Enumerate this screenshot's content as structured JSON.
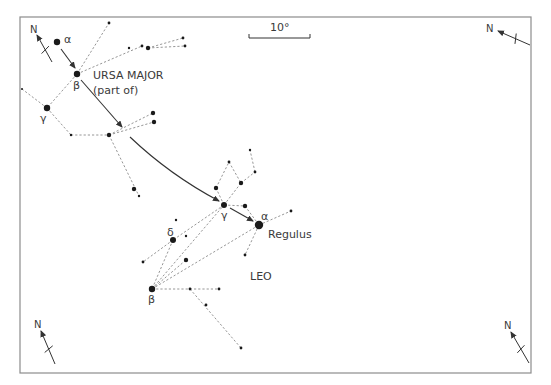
{
  "diagram": {
    "frame": {
      "x": 20,
      "y": 17,
      "w": 511,
      "h": 356,
      "color": "#8c8c8c"
    },
    "scale_bar": {
      "label": "10°",
      "x1": 249,
      "x2": 310,
      "y": 38
    },
    "constellations": [
      {
        "name": "URSA MAJOR",
        "subtitle": "(part of)"
      },
      {
        "name": "LEO"
      }
    ],
    "named_stars": [
      {
        "label": "Regulus",
        "greek": "α",
        "constellation": "Leo"
      }
    ],
    "greek_labels": {
      "uma_alpha": "α",
      "uma_beta": "β",
      "uma_gamma": "γ",
      "leo_gamma": "γ",
      "leo_alpha": "α",
      "leo_delta": "δ",
      "leo_beta": "β"
    },
    "compass_label": "N",
    "stars": [
      {
        "id": "uma_alpha",
        "x": 57,
        "y": 42,
        "r": 3.2
      },
      {
        "id": "uma_beta",
        "x": 77,
        "y": 74,
        "r": 3.2
      },
      {
        "id": "uma_gamma",
        "x": 47,
        "y": 108,
        "r": 3.2
      },
      {
        "id": "uma_top",
        "x": 109,
        "y": 23,
        "r": 1.4
      },
      {
        "id": "uma_r1",
        "x": 129,
        "y": 48,
        "r": 1.2
      },
      {
        "id": "uma_r2",
        "x": 142,
        "y": 46,
        "r": 1.4
      },
      {
        "id": "uma_r3",
        "x": 148,
        "y": 48,
        "r": 2.2
      },
      {
        "id": "uma_r4",
        "x": 183,
        "y": 38,
        "r": 1.4
      },
      {
        "id": "uma_r5",
        "x": 185,
        "y": 46,
        "r": 1.4
      },
      {
        "id": "uma_left",
        "x": 22,
        "y": 89,
        "r": 1.0
      },
      {
        "id": "uma_m1",
        "x": 71,
        "y": 135,
        "r": 1.2
      },
      {
        "id": "uma_m2",
        "x": 109,
        "y": 135,
        "r": 2.2
      },
      {
        "id": "uma_m3",
        "x": 153,
        "y": 113,
        "r": 2.2
      },
      {
        "id": "uma_m4",
        "x": 154,
        "y": 122,
        "r": 2.2
      },
      {
        "id": "uma_m5",
        "x": 134,
        "y": 189,
        "r": 2.2
      },
      {
        "id": "uma_m6",
        "x": 139,
        "y": 196,
        "r": 1.2
      },
      {
        "id": "leo_gamma",
        "x": 224,
        "y": 205,
        "r": 3.0
      },
      {
        "id": "leo_alpha",
        "x": 259,
        "y": 225,
        "r": 4.2
      },
      {
        "id": "leo_delta",
        "x": 173,
        "y": 240,
        "r": 3.0
      },
      {
        "id": "leo_beta",
        "x": 152,
        "y": 289,
        "r": 3.2
      },
      {
        "id": "leo_a1",
        "x": 216,
        "y": 188,
        "r": 2.2
      },
      {
        "id": "leo_a2",
        "x": 241,
        "y": 183,
        "r": 2.2
      },
      {
        "id": "leo_a3",
        "x": 229,
        "y": 162,
        "r": 1.4
      },
      {
        "id": "leo_a4",
        "x": 255,
        "y": 172,
        "r": 1.4
      },
      {
        "id": "leo_a5",
        "x": 250,
        "y": 150,
        "r": 1.2
      },
      {
        "id": "leo_a6",
        "x": 245,
        "y": 206,
        "r": 2.2
      },
      {
        "id": "leo_a7",
        "x": 291,
        "y": 211,
        "r": 1.4
      },
      {
        "id": "leo_a8",
        "x": 245,
        "y": 255,
        "r": 1.4
      },
      {
        "id": "leo_d1",
        "x": 143,
        "y": 262,
        "r": 1.4
      },
      {
        "id": "leo_d2",
        "x": 186,
        "y": 236,
        "r": 1.2
      },
      {
        "id": "leo_d3",
        "x": 176,
        "y": 220,
        "r": 1.2
      },
      {
        "id": "leo_b1",
        "x": 186,
        "y": 260,
        "r": 2.2
      },
      {
        "id": "leo_b2",
        "x": 190,
        "y": 289,
        "r": 1.4
      },
      {
        "id": "leo_b3",
        "x": 219,
        "y": 289,
        "r": 1.4
      },
      {
        "id": "leo_b4",
        "x": 206,
        "y": 305,
        "r": 1.4
      },
      {
        "id": "leo_b5",
        "x": 241,
        "y": 348,
        "r": 1.4
      }
    ],
    "dashed_lines": [
      [
        "uma_beta",
        "uma_top"
      ],
      [
        "uma_beta",
        "uma_r2"
      ],
      [
        "uma_r3",
        "uma_r4"
      ],
      [
        "uma_r3",
        "uma_r5"
      ],
      [
        "uma_beta",
        "uma_gamma"
      ],
      [
        "uma_gamma",
        "uma_left"
      ],
      [
        "uma_gamma",
        "uma_m1"
      ],
      [
        "uma_m1",
        "uma_m2"
      ],
      [
        "uma_m2",
        "uma_m3"
      ],
      [
        "uma_m2",
        "uma_m4"
      ],
      [
        "uma_m2",
        "uma_m6"
      ],
      [
        "leo_gamma",
        "leo_a1"
      ],
      [
        "leo_a1",
        "leo_a3"
      ],
      [
        "leo_a3",
        "leo_a2"
      ],
      [
        "leo_gamma",
        "leo_a2"
      ],
      [
        "leo_a2",
        "leo_a4"
      ],
      [
        "leo_a4",
        "leo_a5"
      ],
      [
        "leo_gamma",
        "leo_a6"
      ],
      [
        "leo_a6",
        "leo_alpha"
      ],
      [
        "leo_alpha",
        "leo_a7"
      ],
      [
        "leo_alpha",
        "leo_a8"
      ],
      [
        "leo_gamma",
        "leo_delta"
      ],
      [
        "leo_delta",
        "leo_d1"
      ],
      [
        "leo_delta",
        "leo_beta"
      ],
      [
        "leo_beta",
        "leo_alpha"
      ],
      [
        "leo_beta",
        "leo_b1"
      ],
      [
        "leo_beta",
        "leo_gamma"
      ],
      [
        "leo_beta",
        "leo_b3"
      ],
      [
        "leo_b2",
        "leo_b5"
      ]
    ],
    "arrows": [
      {
        "from": [
          61,
          49
        ],
        "to": [
          75,
          68
        ],
        "type": "line"
      },
      {
        "from": [
          81,
          80
        ],
        "to": [
          122,
          127
        ],
        "type": "line"
      },
      {
        "from": [
          130,
          137
        ],
        "ctrl": [
          170,
          175
        ],
        "to": [
          219,
          201
        ],
        "type": "curve"
      },
      {
        "from": [
          230,
          208
        ],
        "to": [
          253,
          221
        ],
        "type": "line"
      }
    ],
    "compasses": [
      {
        "position": "top-left",
        "tail": [
          52,
          62
        ],
        "head": [
          37,
          35
        ],
        "n_x": 30,
        "n_y": 34
      },
      {
        "position": "top-right",
        "tail": [
          530,
          45
        ],
        "head": [
          498,
          31
        ],
        "n_x": 486,
        "n_y": 33
      },
      {
        "position": "bottom-left",
        "tail": [
          55,
          364
        ],
        "head": [
          41,
          331
        ],
        "n_x": 34,
        "n_y": 328
      },
      {
        "position": "bottom-right",
        "tail": [
          529,
          363
        ],
        "head": [
          511,
          332
        ],
        "n_x": 504,
        "n_y": 330
      }
    ]
  }
}
